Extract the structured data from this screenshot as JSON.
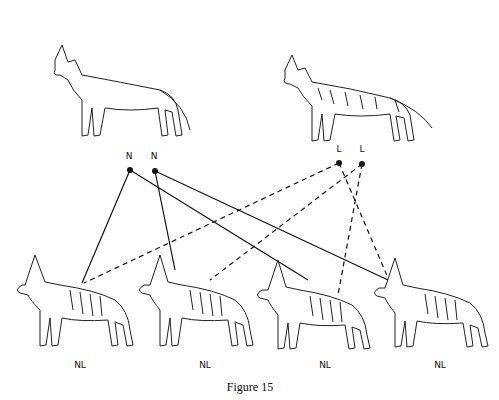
{
  "figure": {
    "caption": "Figure 15",
    "parents": [
      {
        "id": "parent-short-coat",
        "coat": "normal",
        "x": 95,
        "y": 80
      },
      {
        "id": "parent-long-coat",
        "coat": "long",
        "x": 350,
        "y": 85
      }
    ],
    "gene_nodes": [
      {
        "label": "N",
        "x": 130,
        "y": 170,
        "label_x": 129,
        "label_y": 155
      },
      {
        "label": "N",
        "x": 155,
        "y": 171,
        "label_x": 154,
        "label_y": 155
      },
      {
        "label": "L",
        "x": 339,
        "y": 163,
        "label_x": 339,
        "label_y": 148
      },
      {
        "label": "L",
        "x": 362,
        "y": 164,
        "label_x": 362,
        "label_y": 148
      }
    ],
    "offspring": [
      {
        "label": "NL",
        "x": 80,
        "label_y": 364
      },
      {
        "label": "NL",
        "x": 205,
        "label_y": 364
      },
      {
        "label": "NL",
        "x": 325,
        "label_y": 364
      },
      {
        "label": "NL",
        "x": 440,
        "label_y": 364
      }
    ],
    "connections": [
      {
        "from": 0,
        "to": [
          82,
          283
        ],
        "style": "solid"
      },
      {
        "from": 0,
        "to": [
          308,
          280
        ],
        "style": "solid"
      },
      {
        "from": 1,
        "to": [
          175,
          270
        ],
        "style": "solid"
      },
      {
        "from": 1,
        "to": [
          388,
          280
        ],
        "style": "solid"
      },
      {
        "from": 2,
        "to": [
          84,
          283
        ],
        "style": "dashed"
      },
      {
        "from": 3,
        "to": [
          210,
          280
        ],
        "style": "dashed"
      },
      {
        "from": 3,
        "to": [
          338,
          295
        ],
        "style": "dashed"
      },
      {
        "from": 2,
        "to": [
          388,
          278
        ],
        "style": "dashed"
      }
    ]
  }
}
